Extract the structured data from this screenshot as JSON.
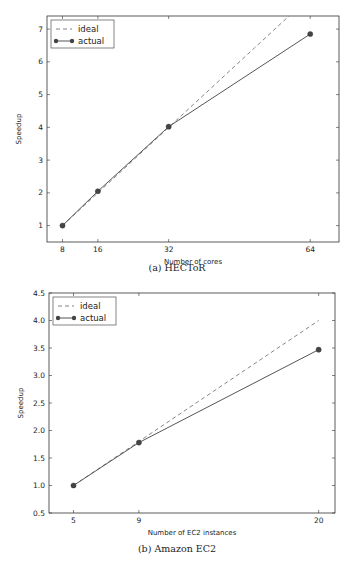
{
  "chart_data": [
    {
      "type": "line",
      "title": "",
      "caption": "(a) HECToR",
      "xlabel": "Number of cores",
      "ylabel": "Speedup",
      "x": [
        8,
        16,
        32,
        64
      ],
      "xticks": [
        8,
        16,
        32,
        64
      ],
      "yticks": [
        1,
        2,
        3,
        4,
        5,
        6,
        7
      ],
      "xlim": [
        4.5,
        70.5
      ],
      "ylim": [
        0.5,
        7.4
      ],
      "grid": false,
      "legend_position": "upper left",
      "series": [
        {
          "name": "ideal",
          "style": "dashed",
          "values": [
            1,
            2,
            4,
            8
          ]
        },
        {
          "name": "actual",
          "style": "solid-marker",
          "values": [
            1.0,
            2.05,
            4.02,
            6.85
          ]
        }
      ]
    },
    {
      "type": "line",
      "title": "",
      "caption": "(b) Amazon EC2",
      "xlabel": "Number of EC2 instances",
      "ylabel": "Speedup",
      "x": [
        5,
        9,
        20
      ],
      "xticks": [
        5,
        9,
        20
      ],
      "yticks": [
        0.5,
        1.0,
        1.5,
        2.0,
        2.5,
        3.0,
        3.5,
        4.0,
        4.5
      ],
      "ytick_labels": [
        "0.5",
        "1.0",
        "1.5",
        "2.0",
        "2.5",
        "3.0",
        "3.5",
        "4.0",
        "4.5"
      ],
      "xlim": [
        3.5,
        21.0
      ],
      "ylim": [
        0.5,
        4.5
      ],
      "grid": false,
      "legend_position": "upper left",
      "series": [
        {
          "name": "ideal",
          "style": "dashed",
          "values": [
            1.0,
            1.8,
            4.0
          ]
        },
        {
          "name": "actual",
          "style": "solid-marker",
          "values": [
            1.0,
            1.78,
            3.47
          ]
        }
      ]
    }
  ],
  "colors": {
    "line": "#555555",
    "marker": "#444444",
    "axis": "#333333"
  }
}
